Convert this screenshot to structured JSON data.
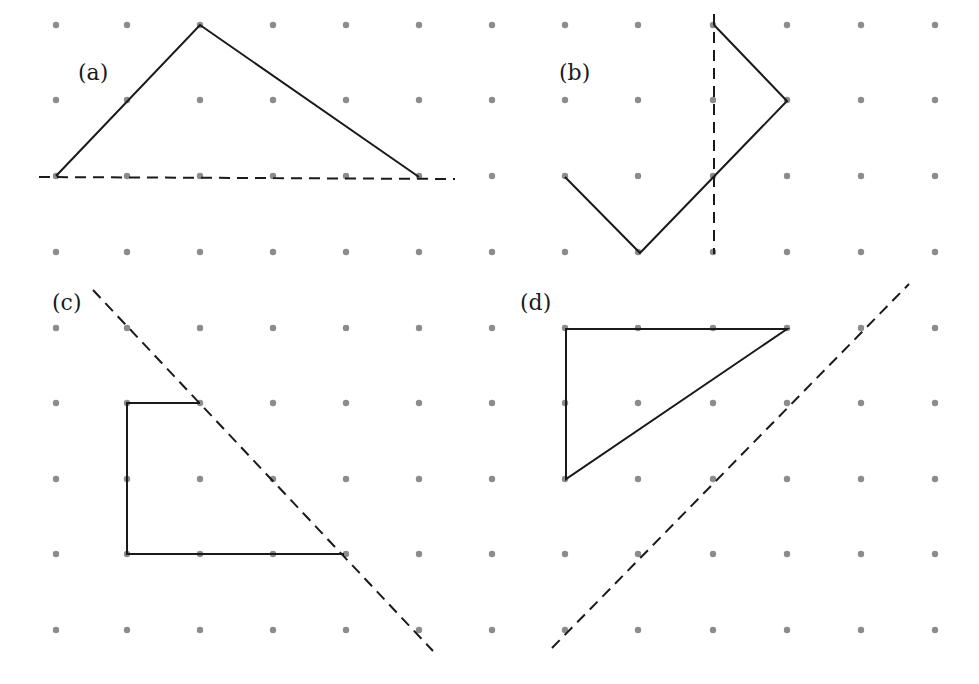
{
  "diagram": {
    "grid": {
      "columns_x": [
        56,
        127,
        200,
        273,
        346,
        419,
        492,
        565,
        638,
        713,
        787,
        861,
        935
      ],
      "rows_y": [
        25,
        100,
        176,
        252,
        328,
        403,
        479,
        554,
        630
      ],
      "dot_radius": 3.2,
      "dot_color": "#8c8c8c"
    },
    "colors": {
      "line": "#1a1a1a",
      "background": "#ffffff"
    },
    "panels": [
      {
        "id": "a",
        "label": "(a)",
        "label_pos": [
          78,
          62
        ],
        "shape": [
          [
            56,
            176
          ],
          [
            200,
            25
          ],
          [
            419,
            177
          ]
        ],
        "shape_closed": false,
        "dashed_line": [
          [
            39,
            177
          ],
          [
            455,
            179
          ]
        ]
      },
      {
        "id": "b",
        "label": "(b)",
        "label_pos": [
          559,
          62
        ],
        "shape": [
          [
            565,
            177
          ],
          [
            640,
            253
          ],
          [
            787,
            101
          ],
          [
            714,
            25
          ]
        ],
        "shape_closed": false,
        "dashed_line": [
          [
            714,
            14
          ],
          [
            714,
            254
          ]
        ]
      },
      {
        "id": "c",
        "label": "(c)",
        "label_pos": [
          52,
          292
        ],
        "shape": [
          [
            200,
            403
          ],
          [
            127,
            403
          ],
          [
            127,
            554
          ],
          [
            344,
            554
          ]
        ],
        "shape_closed": false,
        "dashed_line": [
          [
            93,
            290
          ],
          [
            433,
            651
          ]
        ]
      },
      {
        "id": "d",
        "label": "(d)",
        "label_pos": [
          520,
          292
        ],
        "shape": [
          [
            566,
            329
          ],
          [
            787,
            329
          ],
          [
            566,
            479
          ]
        ],
        "shape_closed": true,
        "dashed_line": [
          [
            552,
            648
          ],
          [
            909,
            284
          ]
        ]
      }
    ]
  }
}
